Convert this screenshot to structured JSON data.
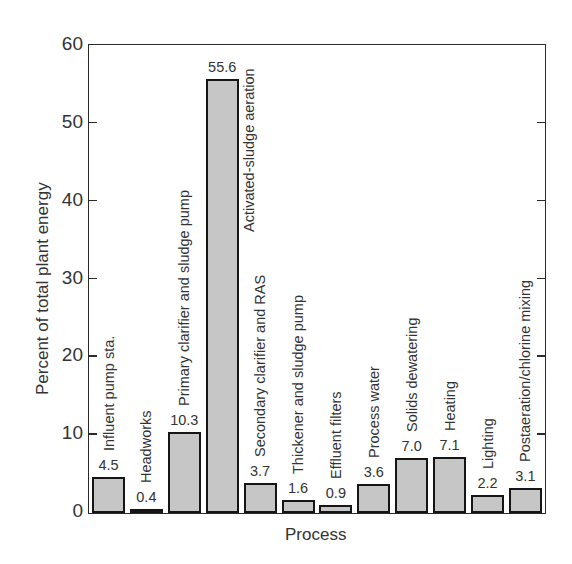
{
  "chart_data": {
    "type": "bar",
    "title": "",
    "xlabel": "Process",
    "ylabel": "Percent of total plant energy",
    "ylim": [
      0,
      60
    ],
    "yticks": [
      0,
      10,
      20,
      30,
      40,
      50,
      60
    ],
    "grid": false,
    "legend": null,
    "categories": [
      "Influent pump sta.",
      "Headworks",
      "Primary clarifier and sludge pump",
      "Activated-sludge aeration",
      "Secondary clarifier and RAS",
      "Thickener and sludge pump",
      "Effluent filters",
      "Process water",
      "Solids dewatering",
      "Heating",
      "Lighting",
      "Postaeration/chlorine mixing"
    ],
    "values": [
      4.5,
      0.4,
      10.3,
      55.6,
      3.7,
      1.6,
      0.9,
      3.6,
      7.0,
      7.1,
      2.2,
      3.1
    ],
    "value_labels": [
      "4.5",
      "0.4",
      "10.3",
      "55.6",
      "3.7",
      "1.6",
      "0.9",
      "3.6",
      "7.0",
      "7.1",
      "2.2",
      "3.1"
    ],
    "colors": {
      "bar_fill": "#c6c6c6",
      "bar_edge": "#151515",
      "axis": "#2a2a2a",
      "text": "#333333"
    }
  }
}
